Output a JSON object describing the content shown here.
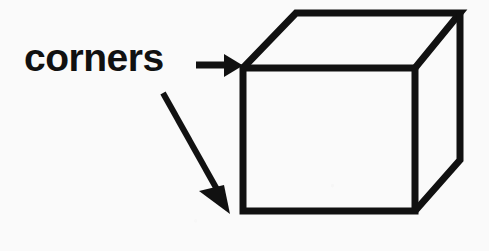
{
  "canvas": {
    "width": 489,
    "height": 251,
    "background_color": "#fafafa",
    "ink_color": "#111111"
  },
  "diagram": {
    "title": "corners",
    "label": {
      "text": "corners",
      "role": "annotation-label",
      "x": 24,
      "y": 36,
      "font_size_px": 39,
      "font_weight": "bold",
      "color": "#111111"
    },
    "annotations": [
      {
        "name": "horizontal-pointer-arrow",
        "icon": "arrow-right-icon",
        "from": [
          196,
          65
        ],
        "to": [
          241,
          65
        ],
        "points_to": "top-front-left-corner",
        "stroke_width": 7,
        "color": "#111111"
      },
      {
        "name": "diagonal-pointer-arrow",
        "icon": "arrow-down-right-icon",
        "from": [
          163,
          93
        ],
        "to": [
          230,
          213
        ],
        "points_to": "bottom-front-left-corner",
        "stroke_width": 6,
        "color": "#111111"
      }
    ],
    "cube": {
      "name": "cube-shape",
      "stroke_width": 7,
      "stroke_color": "#111111",
      "fill_color": "none",
      "vertices": {
        "front_top_left": [
          243,
          68
        ],
        "front_top_right": [
          415,
          68
        ],
        "front_bottom_right": [
          415,
          211
        ],
        "front_bottom_left": [
          243,
          211
        ],
        "back_top_left": [
          296,
          13
        ],
        "back_top_right": [
          460,
          13
        ],
        "back_bottom_right": [
          460,
          160
        ]
      },
      "edges": [
        {
          "name": "front-face-top",
          "from": "front_top_left",
          "to": "front_top_right"
        },
        {
          "name": "front-face-right",
          "from": "front_top_right",
          "to": "front_bottom_right"
        },
        {
          "name": "front-face-bottom",
          "from": "front_bottom_right",
          "to": "front_bottom_left"
        },
        {
          "name": "front-face-left",
          "from": "front_bottom_left",
          "to": "front_top_left"
        },
        {
          "name": "top-face-left-receding",
          "from": "front_top_left",
          "to": "back_top_left"
        },
        {
          "name": "top-face-back",
          "from": "back_top_left",
          "to": "back_top_right"
        },
        {
          "name": "top-face-right-receding",
          "from": "back_top_right",
          "to": "front_top_right"
        },
        {
          "name": "right-face-back-vertical",
          "from": "back_top_right",
          "to": "back_bottom_right"
        },
        {
          "name": "right-face-bottom-receding",
          "from": "back_bottom_right",
          "to": "front_bottom_right"
        }
      ],
      "corner_count": 7
    }
  }
}
